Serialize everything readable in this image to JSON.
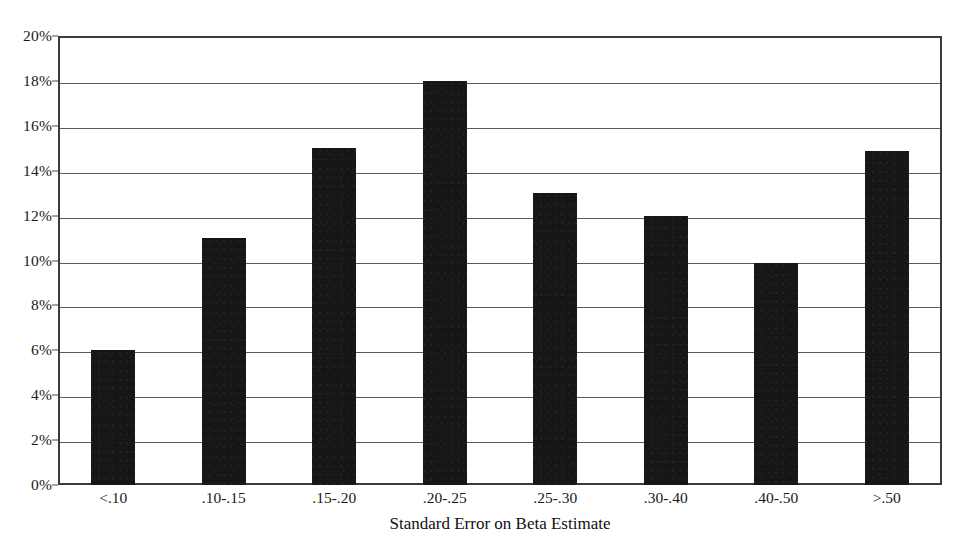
{
  "chart_data": {
    "type": "bar",
    "title": "",
    "subtitle": "",
    "xlabel": "Standard Error on Beta Estimate",
    "ylabel": "",
    "categories": [
      "<.10",
      ".10-.15",
      ".15-.20",
      ".20-.25",
      ".25-.30",
      ".30-.40",
      ".40-.50",
      ">.50"
    ],
    "values": [
      6.0,
      11.0,
      15.0,
      18.0,
      13.0,
      12.0,
      9.9,
      14.9
    ],
    "value_unit": "percent",
    "ylim": [
      0,
      20
    ],
    "ytick_values": [
      0,
      2,
      4,
      6,
      8,
      10,
      12,
      14,
      16,
      18,
      20
    ],
    "ytick_labels": [
      "0%",
      "2%",
      "4%",
      "6%",
      "8%",
      "10%",
      "12%",
      "14%",
      "16%",
      "18%",
      "20%"
    ],
    "grid": true,
    "grid_axis": "y",
    "legend": false,
    "legend_position": "none",
    "series": [
      {
        "name": "Share of sample",
        "values": [
          6.0,
          11.0,
          15.0,
          18.0,
          13.0,
          12.0,
          9.9,
          14.9
        ]
      }
    ],
    "annotations": []
  },
  "style": {
    "bar_color": "#161616",
    "grid_color": "#5a5a5a",
    "frame_color": "#3a3a3a",
    "background_color": "#ffffff",
    "text_color": "#111111"
  }
}
